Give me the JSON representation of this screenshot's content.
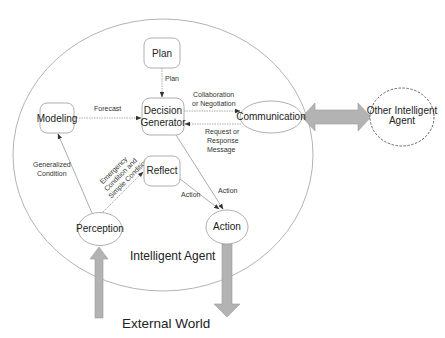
{
  "diagram": {
    "container": {
      "label": "Intelligent Agent"
    },
    "external": {
      "label": "External World",
      "other_agent": "Other Intelligent Agent",
      "other_agent_lines": [
        "Other Intelligent",
        "Agent"
      ]
    },
    "nodes": {
      "plan": "Plan",
      "modeling": "Modeling",
      "decision": [
        "Decision",
        "Generator"
      ],
      "reflect": "Reflect",
      "communication": "Communication",
      "perception": "Perception",
      "action": "Action"
    },
    "edges": {
      "plan_to_decision": "Plan",
      "modeling_to_decision": "Forecast",
      "decision_to_comm": [
        "Collaboration",
        "or Negotiation"
      ],
      "comm_to_decision": [
        "Request or",
        "Response",
        "Message"
      ],
      "perception_to_modeling": [
        "Generalized",
        "Condition"
      ],
      "perception_to_reflect": [
        "Emergency",
        "Condition and",
        "Simple Condition"
      ],
      "reflect_to_action": "Action",
      "decision_to_action": "Action"
    },
    "colors": {
      "stroke": "#8a8a8a",
      "node_stroke": "#9a9a9a",
      "big_arrow_fill": "#b3b3b3",
      "big_arrow_stroke": "#9c9c9c",
      "text": "#222222"
    }
  }
}
